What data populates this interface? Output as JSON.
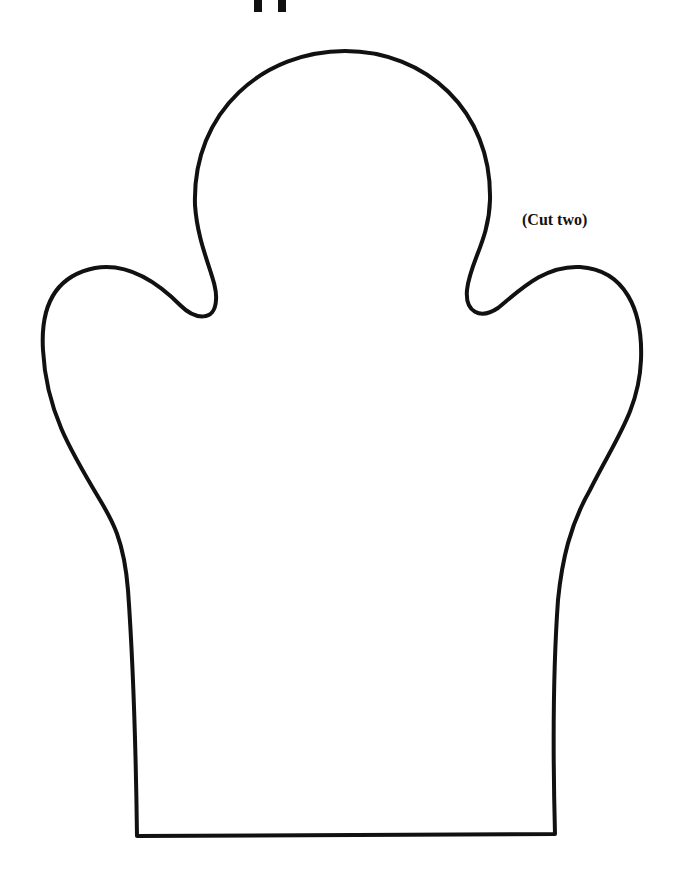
{
  "page": {
    "title_fragment": "pp",
    "title_note": "Title cropped at top edge; only descenders visible"
  },
  "pattern": {
    "name": "Hand puppet template",
    "label": "(Cut two)",
    "stroke_color": "#111111",
    "background_color": "#ffffff"
  }
}
